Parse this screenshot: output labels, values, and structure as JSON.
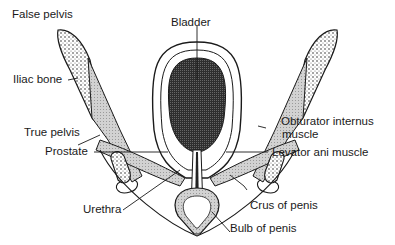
{
  "diagram": {
    "labels": {
      "false_pelvis": "False pelvis",
      "bladder": "Bladder",
      "iliac_bone": "Iliac bone",
      "obturator_internus_1": "Obturator internus",
      "obturator_internus_2": "muscle",
      "true_pelvis": "True pelvis",
      "prostate": "Prostate",
      "levator_ani": "Levator ani muscle",
      "crus_of_penis": "Crus of penis",
      "urethra": "Urethra",
      "bulb_of_penis": "Bulb of penis"
    },
    "colors": {
      "ink": "#1a1a1a",
      "bladder_fill": "#3a3a3a",
      "muscle_fill": "#c8c8c8",
      "background": "#ffffff"
    }
  }
}
